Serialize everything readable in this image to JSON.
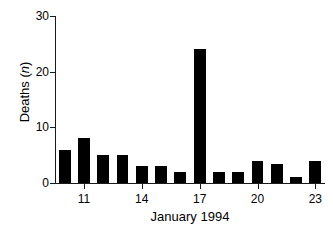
{
  "chart_data": {
    "type": "bar",
    "title": "",
    "xlabel": "January 1994",
    "ylabel": "Deaths (n)",
    "ylabel_prefix": "Deaths (",
    "ylabel_italic": "n",
    "ylabel_suffix": ")",
    "categories": [
      10,
      11,
      12,
      13,
      14,
      15,
      16,
      17,
      18,
      19,
      20,
      21,
      22,
      23
    ],
    "values": [
      6,
      8,
      5,
      5,
      3,
      3,
      2,
      24,
      2,
      2,
      4,
      3.5,
      1,
      4
    ],
    "xlim": [
      9.5,
      23.5
    ],
    "ylim": [
      0,
      30
    ],
    "ytick_values": [
      0,
      10,
      20,
      30
    ],
    "ytick_labels": [
      "0",
      "10",
      "20",
      "30"
    ],
    "xtick_values": [
      11,
      14,
      17,
      20,
      23
    ],
    "xtick_labels": [
      "11",
      "14",
      "17",
      "20",
      "23"
    ],
    "grid": false,
    "legend": false,
    "bar_color": "#000000",
    "axis_color": "#1a1a1a"
  }
}
